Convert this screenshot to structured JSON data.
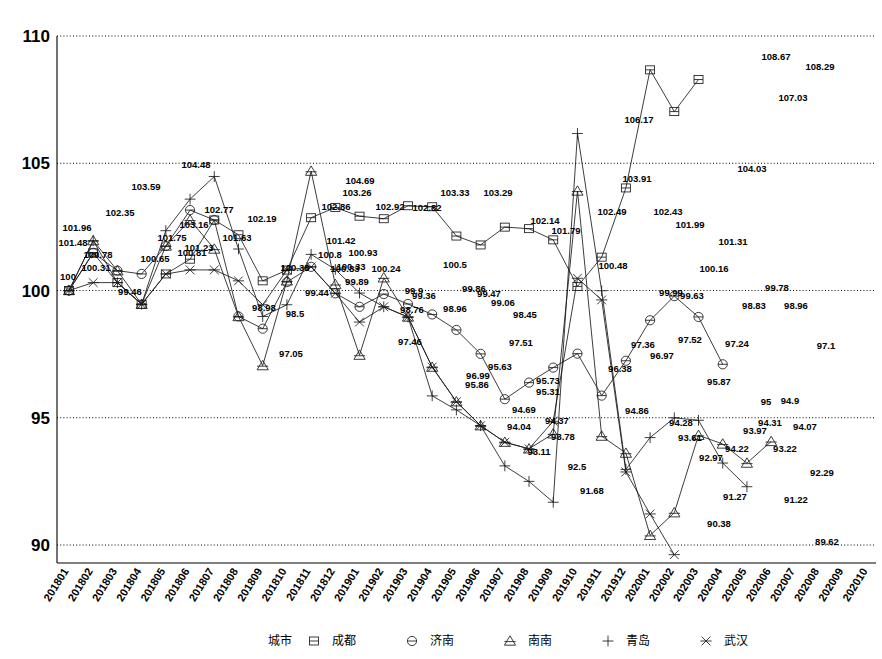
{
  "chart_data": {
    "type": "line",
    "title": "",
    "xlabel": "",
    "ylabel": "",
    "ylim": [
      90,
      110
    ],
    "yticks": [
      90,
      95,
      100,
      105,
      110
    ],
    "grid": true,
    "legend_position": "bottom",
    "legend_title": "城市",
    "categories": [
      "201801",
      "201802",
      "201803",
      "201804",
      "201805",
      "201806",
      "201807",
      "201808",
      "201809",
      "201810",
      "201811",
      "201812",
      "201901",
      "201902",
      "201903",
      "201904",
      "201905",
      "201906",
      "201907",
      "201908",
      "201909",
      "201910",
      "201911",
      "201912",
      "202001",
      "202002",
      "202003",
      "202004",
      "202005",
      "202006",
      "202007",
      "202008",
      "202009",
      "202010"
    ],
    "series": [
      {
        "name": "成都",
        "marker": "square",
        "values": [
          100,
          101.48,
          100.31,
          99.46,
          100.65,
          101.23,
          102.77,
          102.19,
          100.38,
          100.8,
          102.86,
          103.26,
          102.92,
          102.82,
          103.33,
          103.29,
          102.14,
          101.79,
          102.49,
          102.43,
          101.99,
          100.16,
          101.31,
          104.03,
          108.67,
          107.03,
          108.29,
          null,
          null,
          null,
          null,
          null,
          null,
          null
        ],
        "labels": [
          "100",
          "101.48",
          "100.31",
          "99.46",
          "100.65",
          "101.23",
          "102.77",
          "102.19",
          "100.38",
          "100.8",
          "102.86",
          "103.26",
          "102.92",
          "102.82",
          "103.33",
          "103.29",
          "102.14",
          "101.79",
          "102.49",
          "102.43",
          "101.99",
          "100.16",
          "101.31",
          "104.03",
          "108.67",
          "107.03",
          "108.29"
        ]
      },
      {
        "name": "济南",
        "marker": "circle",
        "values": [
          100,
          101.48,
          100.78,
          100.65,
          101.75,
          103.16,
          102.77,
          98.98,
          98.5,
          100.33,
          100.93,
          99.89,
          99.36,
          99.86,
          99.47,
          99.06,
          98.45,
          97.51,
          95.73,
          96.38,
          96.97,
          97.52,
          95.87,
          97.24,
          98.83,
          99.78,
          98.96,
          97.1,
          null,
          null,
          null,
          null,
          null,
          null
        ],
        "labels": [
          "100",
          "101.48",
          "100.78",
          "100.65",
          "101.75",
          "103.16",
          "102.77",
          "98.98",
          "98.5",
          "100.33",
          "100.93",
          "99.89",
          "99.36",
          "99.86",
          "99.47",
          "99.06",
          "98.45",
          "97.51",
          "95.73",
          "96.38",
          "96.97",
          "97.52",
          "95.87",
          "97.24",
          "98.83",
          "99.78",
          "98.96",
          "97.1"
        ]
      },
      {
        "name": "南南",
        "marker": "triangle",
        "values": [
          100,
          101.96,
          100.78,
          99.46,
          101.75,
          102.77,
          101.63,
          98.98,
          97.05,
          100.38,
          104.69,
          100.24,
          97.46,
          100.5,
          98.96,
          96.99,
          95.63,
          94.69,
          94.04,
          93.78,
          94.37,
          103.91,
          94.28,
          93.61,
          90.38,
          91.27,
          94.31,
          93.97,
          93.22,
          94.07,
          null,
          null,
          null,
          null
        ],
        "labels": [
          "100",
          "101.96",
          "100.78",
          "99.46",
          "101.75",
          "102.77",
          "101.63",
          "98.98",
          "97.05",
          "100.38",
          "104.69",
          "100.24",
          "97.46",
          "100.5",
          "98.96",
          "96.99",
          "95.63",
          "94.69",
          "94.04",
          "93.78",
          "94.37",
          "103.91",
          "94.28",
          "93.61",
          "90.38",
          "91.27",
          "94.31",
          "93.97",
          "93.22",
          "94.07"
        ]
      },
      {
        "name": "青岛",
        "marker": "plus",
        "values": [
          100,
          101.96,
          100.31,
          99.46,
          102.35,
          103.59,
          104.48,
          101.63,
          98.98,
          99.44,
          101.42,
          100.83,
          99.9,
          99.36,
          98.96,
          95.86,
          95.31,
          94.69,
          93.11,
          92.5,
          91.68,
          106.17,
          99.99,
          92.97,
          94.22,
          95,
          94.9,
          93.22,
          92.29,
          null,
          null,
          null,
          null,
          null
        ],
        "labels": [
          "100",
          "101.96",
          "100.31",
          "99.46",
          "102.35",
          "103.59",
          "104.48",
          "101.63",
          "98.98",
          "99.44",
          "101.42",
          "100.83",
          "99.9",
          "99.36",
          "98.96",
          "95.86",
          "95.31",
          "94.69",
          "93.11",
          "92.5",
          "91.68",
          "106.17",
          "99.99",
          "92.97",
          "94.22",
          "95",
          "94.9",
          "93.22",
          "92.29"
        ]
      },
      {
        "name": "武汉",
        "marker": "x",
        "values": [
          100,
          100.31,
          100.31,
          99.46,
          100.65,
          100.81,
          100.81,
          100.38,
          99.44,
          100.8,
          100.93,
          99.89,
          98.76,
          99.36,
          98.96,
          96.99,
          95.63,
          94.69,
          94.04,
          93.78,
          94.86,
          100.48,
          99.63,
          92.87,
          91.22,
          89.62,
          null,
          null,
          null,
          null,
          null,
          null,
          null,
          null
        ],
        "labels": [
          "100",
          "100.31",
          "100.31",
          "99.46",
          "100.65",
          "100.81",
          "100.81",
          "100.38",
          "99.44",
          "100.8",
          "100.93",
          "99.89",
          "98.76",
          "99.36",
          "98.96",
          "96.99",
          "95.63",
          "94.69",
          "94.04",
          "93.78",
          "94.86",
          "100.48",
          "99.63",
          "92.87",
          "91.22",
          "89.62"
        ]
      }
    ],
    "point_labels": [
      {
        "text": "100",
        "x": 68,
        "y": 280
      },
      {
        "text": "101.96",
        "x": 77,
        "y": 231
      },
      {
        "text": "101.48",
        "x": 73,
        "y": 246
      },
      {
        "text": "100.78",
        "x": 98,
        "y": 258
      },
      {
        "text": "100.31",
        "x": 96,
        "y": 271
      },
      {
        "text": "99.46",
        "x": 130,
        "y": 295
      },
      {
        "text": "102.35",
        "x": 120,
        "y": 216
      },
      {
        "text": "103.59",
        "x": 146,
        "y": 190
      },
      {
        "text": "100.65",
        "x": 155,
        "y": 262
      },
      {
        "text": "101.75",
        "x": 172,
        "y": 241
      },
      {
        "text": "103.16",
        "x": 194,
        "y": 228
      },
      {
        "text": "104.48",
        "x": 196,
        "y": 168
      },
      {
        "text": "101.23",
        "x": 199,
        "y": 251
      },
      {
        "text": "102.77",
        "x": 219,
        "y": 213
      },
      {
        "text": "100.81",
        "x": 192,
        "y": 256
      },
      {
        "text": "102.19",
        "x": 262,
        "y": 222
      },
      {
        "text": "101.63",
        "x": 237,
        "y": 241
      },
      {
        "text": "98.98",
        "x": 264,
        "y": 311
      },
      {
        "text": "98.5",
        "x": 295,
        "y": 317
      },
      {
        "text": "97.05",
        "x": 291,
        "y": 357
      },
      {
        "text": "100.38",
        "x": 295,
        "y": 271
      },
      {
        "text": "99.44",
        "x": 317,
        "y": 296
      },
      {
        "text": "100.8",
        "x": 330,
        "y": 258
      },
      {
        "text": "102.86",
        "x": 336,
        "y": 210
      },
      {
        "text": "100.33",
        "x": 351,
        "y": 270
      },
      {
        "text": "104.69",
        "x": 360,
        "y": 184
      },
      {
        "text": "103.26",
        "x": 357,
        "y": 196
      },
      {
        "text": "101.42",
        "x": 341,
        "y": 244
      },
      {
        "text": "100.93",
        "x": 363,
        "y": 256
      },
      {
        "text": "100.83",
        "x": 345,
        "y": 272
      },
      {
        "text": "99.89",
        "x": 357,
        "y": 285
      },
      {
        "text": "102.92",
        "x": 390,
        "y": 210
      },
      {
        "text": "100.24",
        "x": 386,
        "y": 272
      },
      {
        "text": "98.76",
        "x": 412,
        "y": 313
      },
      {
        "text": "99.9",
        "x": 414,
        "y": 294
      },
      {
        "text": "99.36",
        "x": 424,
        "y": 299
      },
      {
        "text": "97.46",
        "x": 410,
        "y": 345
      },
      {
        "text": "102.82",
        "x": 427,
        "y": 211
      },
      {
        "text": "100.5",
        "x": 455,
        "y": 268
      },
      {
        "text": "98.96",
        "x": 455,
        "y": 312
      },
      {
        "text": "99.86",
        "x": 474,
        "y": 292
      },
      {
        "text": "103.33",
        "x": 455,
        "y": 196
      },
      {
        "text": "99.47",
        "x": 489,
        "y": 297
      },
      {
        "text": "96.99",
        "x": 478,
        "y": 379
      },
      {
        "text": "103.29",
        "x": 498,
        "y": 196
      },
      {
        "text": "99.06",
        "x": 503,
        "y": 306
      },
      {
        "text": "95.86",
        "x": 477,
        "y": 388
      },
      {
        "text": "95.63",
        "x": 500,
        "y": 370
      },
      {
        "text": "98.45",
        "x": 525,
        "y": 318
      },
      {
        "text": "97.51",
        "x": 521,
        "y": 346
      },
      {
        "text": "102.14",
        "x": 545,
        "y": 224
      },
      {
        "text": "94.69",
        "x": 524,
        "y": 413
      },
      {
        "text": "95.73",
        "x": 548,
        "y": 384
      },
      {
        "text": "95.31",
        "x": 548,
        "y": 395
      },
      {
        "text": "101.79",
        "x": 566,
        "y": 234
      },
      {
        "text": "94.04",
        "x": 519,
        "y": 430
      },
      {
        "text": "94.37",
        "x": 557,
        "y": 424
      },
      {
        "text": "93.78",
        "x": 563,
        "y": 440
      },
      {
        "text": "93.11",
        "x": 539,
        "y": 455
      },
      {
        "text": "92.5",
        "x": 577,
        "y": 470
      },
      {
        "text": "91.68",
        "x": 592,
        "y": 494
      },
      {
        "text": "102.49",
        "x": 612,
        "y": 215
      },
      {
        "text": "106.17",
        "x": 639,
        "y": 123
      },
      {
        "text": "103.91",
        "x": 637,
        "y": 182
      },
      {
        "text": "100.48",
        "x": 613,
        "y": 269
      },
      {
        "text": "96.38",
        "x": 620,
        "y": 372
      },
      {
        "text": "94.86",
        "x": 637,
        "y": 414
      },
      {
        "text": "97.36",
        "x": 643,
        "y": 348
      },
      {
        "text": "96.97",
        "x": 662,
        "y": 359
      },
      {
        "text": "102.43",
        "x": 668,
        "y": 215
      },
      {
        "text": "99.99",
        "x": 671,
        "y": 296
      },
      {
        "text": "94.28",
        "x": 681,
        "y": 426
      },
      {
        "text": "101.99",
        "x": 690,
        "y": 228
      },
      {
        "text": "99.63",
        "x": 692,
        "y": 299
      },
      {
        "text": "97.52",
        "x": 690,
        "y": 343
      },
      {
        "text": "93.61",
        "x": 690,
        "y": 441
      },
      {
        "text": "100.16",
        "x": 714,
        "y": 272
      },
      {
        "text": "95.87",
        "x": 719,
        "y": 385
      },
      {
        "text": "92.97",
        "x": 711,
        "y": 461
      },
      {
        "text": "90.38",
        "x": 719,
        "y": 527
      },
      {
        "text": "101.31",
        "x": 733,
        "y": 245
      },
      {
        "text": "97.24",
        "x": 737,
        "y": 347
      },
      {
        "text": "94.22",
        "x": 737,
        "y": 452
      },
      {
        "text": "91.27",
        "x": 735,
        "y": 500
      },
      {
        "text": "104.03",
        "x": 752,
        "y": 172
      },
      {
        "text": "98.83",
        "x": 754,
        "y": 309
      },
      {
        "text": "93.97",
        "x": 755,
        "y": 434
      },
      {
        "text": "95",
        "x": 766,
        "y": 405
      },
      {
        "text": "94.31",
        "x": 770,
        "y": 426
      },
      {
        "text": "108.67",
        "x": 776,
        "y": 60
      },
      {
        "text": "99.78",
        "x": 777,
        "y": 291
      },
      {
        "text": "94.9",
        "x": 790,
        "y": 404
      },
      {
        "text": "93.22",
        "x": 785,
        "y": 452
      },
      {
        "text": "91.22",
        "x": 796,
        "y": 503
      },
      {
        "text": "107.03",
        "x": 793,
        "y": 101
      },
      {
        "text": "98.96",
        "x": 796,
        "y": 309
      },
      {
        "text": "108.29",
        "x": 820,
        "y": 70
      },
      {
        "text": "94.07",
        "x": 805,
        "y": 430
      },
      {
        "text": "97.1",
        "x": 826,
        "y": 349
      },
      {
        "text": "92.29",
        "x": 822,
        "y": 476
      },
      {
        "text": "89.62",
        "x": 827,
        "y": 545
      }
    ]
  },
  "legend": {
    "title": "城市",
    "items": [
      {
        "label": "成都",
        "marker": "square"
      },
      {
        "label": "济南",
        "marker": "circle"
      },
      {
        "label": "南南",
        "marker": "triangle"
      },
      {
        "label": "青岛",
        "marker": "plus"
      },
      {
        "label": "武汉",
        "marker": "x"
      }
    ]
  }
}
